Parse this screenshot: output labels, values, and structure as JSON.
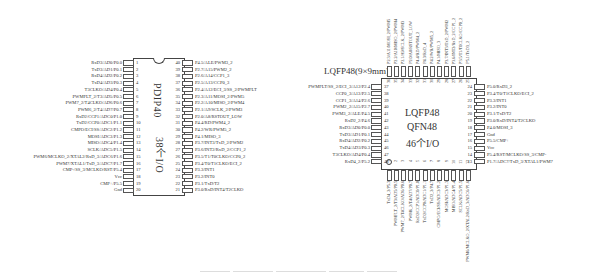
{
  "pdip": {
    "name": "PDIP40",
    "io": "38个I/O",
    "left_pins": [
      {
        "n": "1",
        "label": "RxD3/AD0/P0.0"
      },
      {
        "n": "2",
        "label": "TxD3/AD1/P0.1"
      },
      {
        "n": "3",
        "label": "RxD4/AD2/P0.2"
      },
      {
        "n": "4",
        "label": "TxD4/AD3/P0.3"
      },
      {
        "n": "5",
        "label": "T3CLKO/AD4/P0.4"
      },
      {
        "n": "6",
        "label": "PWMFLT_2/T3/AD5/P0.5"
      },
      {
        "n": "7",
        "label": "PWM7_2/T4CLKO/AD6/P0.6"
      },
      {
        "n": "8",
        "label": "PWM6_2/T4/AD7/P0.7"
      },
      {
        "n": "9",
        "label": "RxD2/CCP1/ADC0/P1.0"
      },
      {
        "n": "10",
        "label": "TxD2/CCP0/ADC1/P1.1"
      },
      {
        "n": "11",
        "label": "CMPO/ECI/SS/ADC2/P1.2"
      },
      {
        "n": "12",
        "label": "MOSI/ADC3/P1.3"
      },
      {
        "n": "13",
        "label": "MISO/ADC4/P1.4"
      },
      {
        "n": "14",
        "label": "SCLK/ADC5/P1.5"
      },
      {
        "n": "15",
        "label": "PWM6/MCLKO_2/XTAL2/RxD_3/ADC6/P1.6"
      },
      {
        "n": "16",
        "label": "PWM7/XTAL1/TxD_3/ADC7/P1.7"
      },
      {
        "n": "17",
        "label": "CMP-/SS_3/MCLKO/RST/P5.4"
      },
      {
        "n": "18",
        "label": "Vcc"
      },
      {
        "n": "19",
        "label": "CMP+/P5.5"
      },
      {
        "n": "20",
        "label": "Gnd"
      }
    ],
    "right_pins": [
      {
        "n": "40",
        "label": "P4.5/ALE/PWM3_2"
      },
      {
        "n": "39",
        "label": "P2.7/A15/PWM2_2"
      },
      {
        "n": "38",
        "label": "P2.6/A14/CCP1_3"
      },
      {
        "n": "37",
        "label": "P2.5/A13/CCP0_3"
      },
      {
        "n": "36",
        "label": "P2.4/A12/ECI_3/SS_2/PWMFLT"
      },
      {
        "n": "35",
        "label": "P2.3/A11/MOSI_2/PWM5"
      },
      {
        "n": "34",
        "label": "P2.2/A10/MISO_2/PWM4"
      },
      {
        "n": "33",
        "label": "P2.1/A9/SCLK_2/PWM3"
      },
      {
        "n": "32",
        "label": "P2.0/A8/RSTOUT_LOW"
      },
      {
        "n": "31",
        "label": "P4.4/RD/PWM4_2"
      },
      {
        "n": "30",
        "label": "P4.2/WR/PWM5_2"
      },
      {
        "n": "29",
        "label": "P4.1/MISO_3"
      },
      {
        "n": "28",
        "label": "P3.7/INT3/TxD_2/PWM2"
      },
      {
        "n": "27",
        "label": "P3.6/INT2/RxD_2/CCP1_2"
      },
      {
        "n": "26",
        "label": "P3.5/T1/T0CLKO/CCP0_2"
      },
      {
        "n": "25",
        "label": "P3.4/T0/T1CLKO/ECI_2"
      },
      {
        "n": "24",
        "label": "P3.3/INT1"
      },
      {
        "n": "23",
        "label": "P3.2/INT0"
      },
      {
        "n": "22",
        "label": "P3.1/TxD/T2"
      },
      {
        "n": "21",
        "label": "P3.0/RxD/INT4/T2CLKO"
      }
    ]
  },
  "lqfp": {
    "package_label": "LQFP48(9×9mm)",
    "name1": "LQFP48",
    "name2": "QFN48",
    "io": "46个I/O",
    "left_pins": [
      {
        "n": "37",
        "label": "PWMFLT/SS_2/ECI_3/A12/P2.4"
      },
      {
        "n": "38",
        "label": "CCP0_3/A13/P2.5"
      },
      {
        "n": "39",
        "label": "CCP1_3/A14/P2.6"
      },
      {
        "n": "40",
        "label": "PWM2_2/A15/P2.7"
      },
      {
        "n": "41",
        "label": "PWM3_2/ALE/P4.5"
      },
      {
        "n": "42",
        "label": "RxD2_2/P4.6"
      },
      {
        "n": "43",
        "label": "RxD3/AD0/P0.0"
      },
      {
        "n": "44",
        "label": "TxD3/AD1/P0.1"
      },
      {
        "n": "45",
        "label": "RxD4/AD2/P0.2"
      },
      {
        "n": "46",
        "label": "TxD4/AD3/P0.3"
      },
      {
        "n": "47",
        "label": "T3CLKO/AD4/P0.4"
      },
      {
        "n": "48",
        "label": "RxD4_2/P5.2"
      }
    ],
    "right_pins": [
      {
        "n": "24",
        "label": "P5.0/RxD3_2"
      },
      {
        "n": "23",
        "label": "P3.4/T0/T1CLKO/ECI_2"
      },
      {
        "n": "22",
        "label": "P3.3/INT1"
      },
      {
        "n": "21",
        "label": "P3.2/INT0"
      },
      {
        "n": "20",
        "label": "P3.1/TxD/T2"
      },
      {
        "n": "19",
        "label": "P3.0/RxD/INT4/T2CLKO"
      },
      {
        "n": "18",
        "label": "P4.0/MOSI_3"
      },
      {
        "n": "17",
        "label": "Gnd"
      },
      {
        "n": "16",
        "label": "P5.5/CMP+"
      },
      {
        "n": "15",
        "label": "Vcc"
      },
      {
        "n": "14",
        "label": "P5.4/RST/MCLKO/SS_3/CMP-"
      },
      {
        "n": "13",
        "label": "P1.7/ADC7/TxD_3/XTAL1/PWM7"
      }
    ],
    "top_pins": [
      {
        "n": "36",
        "label": "P2.3/A11/MOSI_2/PWM5"
      },
      {
        "n": "35",
        "label": "P2.2/A10/MISO_2/PWM4"
      },
      {
        "n": "34",
        "label": "P2.1/A9/SCLK_2/PWM3"
      },
      {
        "n": "33",
        "label": "P2.0/A8/RSTOUT_LOW"
      },
      {
        "n": "32",
        "label": "P4.4/RD/PWM4_2"
      },
      {
        "n": "31",
        "label": "P4.3/RxD_4"
      },
      {
        "n": "30",
        "label": "P4.2/WR/PWM5_2"
      },
      {
        "n": "29",
        "label": "P4.1/MISO_3"
      },
      {
        "n": "28",
        "label": "P3.7/INT3/TxD_2/PWM2"
      },
      {
        "n": "27",
        "label": "P3.6/INT2/RxD_2/CCP1_2"
      },
      {
        "n": "26",
        "label": "P3.5/T1/T0CLKO/CCP0_2"
      },
      {
        "n": "25",
        "label": "P5.1/TxD3_2"
      }
    ],
    "bottom_pins": [
      {
        "n": "1",
        "label": "TxD4_2/P5.3"
      },
      {
        "n": "2",
        "label": "PWMFLT_2/T3/AD5/P0.5"
      },
      {
        "n": "3",
        "label": "PWM7_2/T4CLKO/AD6/P0.6"
      },
      {
        "n": "4",
        "label": "PWM6_2/T4/AD7/P0.7"
      },
      {
        "n": "5",
        "label": "RxD2/CCP1/ADC0/P1.0"
      },
      {
        "n": "6",
        "label": "TxD2/CCP0/ADC1/P1.1"
      },
      {
        "n": "7",
        "label": "TxD2_2/P4.7"
      },
      {
        "n": "8",
        "label": "CMPO/ECI/SS/ADC2/P1.2"
      },
      {
        "n": "9",
        "label": "MOSI/ADC3/P1.3"
      },
      {
        "n": "10",
        "label": "MISO/ADC4/P1.4"
      },
      {
        "n": "11",
        "label": "SCLK/ADC5/P1.5"
      },
      {
        "n": "12",
        "label": "PWM6/MCLKO_2/XTAL2/RxD_3/ADC6/P1.6"
      }
    ]
  }
}
